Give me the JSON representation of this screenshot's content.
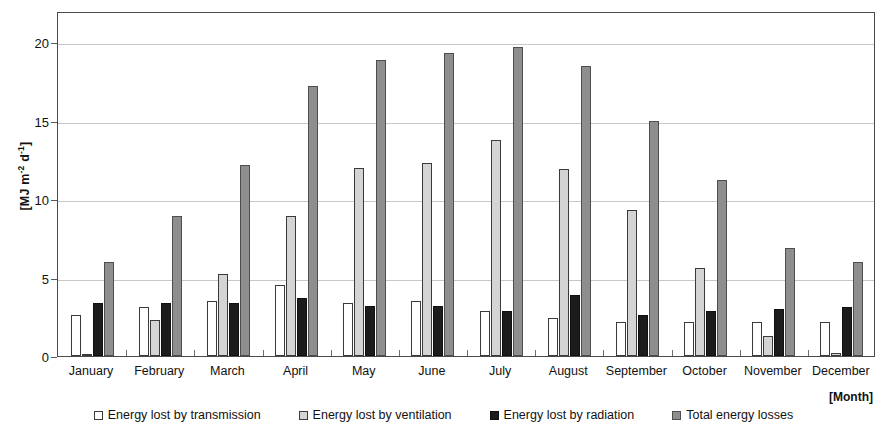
{
  "chart_data": {
    "type": "bar",
    "title": "",
    "subtitle": "",
    "xlabel": "[Month]",
    "ylabel": "[MJ m-2 d-1]",
    "ylabel_parts": {
      "prefix": "[MJ m",
      "sup1": "-2",
      "mid": " d",
      "sup2": "-1",
      "suffix": "]"
    },
    "categories": [
      "January",
      "February",
      "March",
      "April",
      "May",
      "June",
      "July",
      "August",
      "September",
      "October",
      "November",
      "December"
    ],
    "series": [
      {
        "name": "Energy lost by transmission",
        "color": "#ffffff",
        "values": [
          2.6,
          3.1,
          3.5,
          4.5,
          3.4,
          3.5,
          2.9,
          2.4,
          2.2,
          2.2,
          2.2,
          2.2
        ]
      },
      {
        "name": "Energy lost by ventilation",
        "color": "#d4d4d4",
        "values": [
          0.05,
          2.3,
          5.2,
          8.9,
          12.0,
          12.3,
          13.8,
          11.9,
          9.3,
          5.6,
          1.3,
          0.2
        ]
      },
      {
        "name": "Energy lost by radiation",
        "color": "#1c1c1c",
        "values": [
          3.4,
          3.4,
          3.4,
          3.7,
          3.2,
          3.2,
          2.9,
          3.9,
          2.6,
          2.9,
          3.0,
          3.1
        ]
      },
      {
        "name": "Total energy losses",
        "color": "#8e8e8e",
        "values": [
          6.0,
          8.9,
          12.2,
          17.2,
          18.9,
          19.3,
          19.7,
          18.5,
          15.0,
          11.2,
          6.9,
          6.0
        ]
      }
    ],
    "ylim": [
      0,
      22
    ],
    "yticks": [
      0,
      5,
      10,
      15,
      20
    ],
    "ytick_labels": [
      "0",
      "5",
      "10",
      "15",
      "20"
    ],
    "grid": true,
    "legend_position": "bottom"
  }
}
